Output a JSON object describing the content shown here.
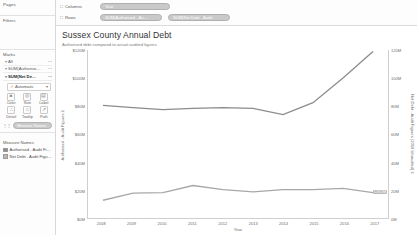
{
  "shelf_panel": {
    "pages": {
      "title": "Pages"
    },
    "filters": {
      "title": "Filters"
    },
    "marks": {
      "title": "Marks",
      "tabs": [
        {
          "label": "All",
          "caret": "▾",
          "right": "⋯"
        },
        {
          "label": "SUM(Authorise…",
          "caret": "▾",
          "right": "⋯"
        },
        {
          "label": "SUM(Net De…",
          "caret": "▾",
          "right": "⋯"
        }
      ],
      "mark_type": {
        "icon": "↗",
        "label": "Automatic",
        "arrow": "▾"
      },
      "buttons": [
        {
          "label": "Color",
          "icon": "■"
        },
        {
          "label": "Size",
          "icon": "◎"
        },
        {
          "label": "Label",
          "icon": "▤"
        },
        {
          "label": "Detail",
          "icon": "∴"
        },
        {
          "label": "Tooltip",
          "icon": "□"
        },
        {
          "label": "Path",
          "icon": "↗"
        }
      ],
      "measure_pill": {
        "icon": "⋮⋮",
        "label": "Measure Names"
      }
    },
    "legend": {
      "title": "Measure Names",
      "items": [
        {
          "label": "Authorised - Audit Fi…",
          "color": "#8c8c8c"
        },
        {
          "label": "Net Debt - Audit Figu…",
          "color": "#a8a8a8"
        }
      ]
    }
  },
  "shelves": {
    "columns": {
      "label": "Columns",
      "icon": "∷",
      "pills": [
        {
          "label": "Year"
        }
      ]
    },
    "rows": {
      "label": "Rows",
      "icon": "∷",
      "pills": [
        {
          "label": "SUM(Authorised - Au…"
        },
        {
          "label": "SUM(Net Debt - Audit"
        }
      ]
    }
  },
  "chart_data": {
    "type": "line",
    "title": "Sussex County Annual Debt",
    "subtitle": "Authorised debt compared to actual audited figures",
    "xlabel": "Year",
    "x": [
      2008,
      2009,
      2010,
      2011,
      2012,
      2013,
      2014,
      2015,
      2016,
      2017
    ],
    "xticks": [
      "2008",
      "2009",
      "2010",
      "2011",
      "2012",
      "2013",
      "2014",
      "2015",
      "2016",
      "2017"
    ],
    "grid": false,
    "legend_position": "left-panel",
    "axes": [
      {
        "side": "left",
        "label": "Authorised - Audit Figures £",
        "ticks": [
          "$120M",
          "$100M",
          "$80M",
          "$60M",
          "$40M",
          "$20M",
          "$0M"
        ],
        "tickvalues": [
          120,
          100,
          80,
          60,
          40,
          20,
          0
        ],
        "ylim": [
          0,
          120
        ]
      },
      {
        "side": "right",
        "label": "Net Debt - Audit Figures (2018 Unaudited) £",
        "ticks": [
          "120M",
          "100M",
          "80M",
          "60M",
          "40M",
          "20M",
          "0M"
        ],
        "tickvalues": [
          120,
          100,
          80,
          60,
          40,
          20,
          0
        ],
        "ylim": [
          0,
          120
        ]
      }
    ],
    "series": [
      {
        "name": "Authorised - Audit Figures",
        "axis": "left",
        "color": "#8c8c8c",
        "values": [
          80.5,
          79.0,
          77.5,
          78.5,
          79.0,
          78.5,
          74.0,
          82.5,
          100.0,
          119.0
        ]
      },
      {
        "name": "Net Debt - Audit Figures (2018 Unaudited)",
        "axis": "right",
        "color": "#a8a8a8",
        "values": [
          13.0,
          18.0,
          18.5,
          23.5,
          20.5,
          19.0,
          20.5,
          20.5,
          21.5,
          18.5
        ]
      }
    ],
    "end_label": "£18.5M"
  }
}
